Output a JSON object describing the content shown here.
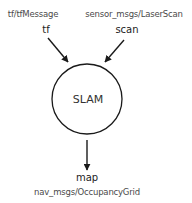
{
  "diagram": {
    "node": {
      "label": "SLAM",
      "cx": 87,
      "cy": 99,
      "r": 35
    },
    "inputs": [
      {
        "topic": "tf",
        "type": "tf/tfMessage",
        "type_x": 33,
        "type_y": 10,
        "topic_x": 46,
        "topic_y": 25,
        "arrow": {
          "x1": 48,
          "y1": 38,
          "x2": 68,
          "y2": 62
        }
      },
      {
        "topic": "scan",
        "type": "sensor_msgs/LaserScan",
        "type_x": 134,
        "type_y": 10,
        "topic_x": 127,
        "topic_y": 25,
        "arrow": {
          "x1": 124,
          "y1": 40,
          "x2": 105,
          "y2": 62
        }
      }
    ],
    "outputs": [
      {
        "topic": "map",
        "type": "nav_msgs/OccupancyGrid",
        "topic_x": 87,
        "topic_y": 173,
        "type_x": 87,
        "type_y": 188,
        "arrow": {
          "x1": 87,
          "y1": 140,
          "x2": 87,
          "y2": 170
        }
      }
    ],
    "colors": {
      "stroke": "#1a1a1a",
      "text": "#333333",
      "type_text": "#4a4a4a"
    }
  }
}
